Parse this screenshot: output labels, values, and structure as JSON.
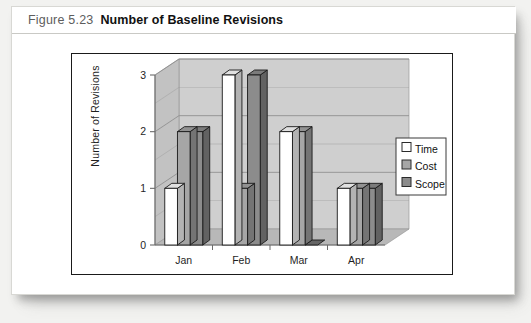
{
  "caption": {
    "figure_number": "Figure 5.23",
    "title": "Number of Baseline Revisions"
  },
  "chart_data": {
    "type": "bar",
    "title": "Number of Baseline Revisions",
    "xlabel": "",
    "ylabel": "Number of Revisions",
    "categories": [
      "Jan",
      "Feb",
      "Mar",
      "Apr"
    ],
    "series": [
      {
        "name": "Time",
        "color": "#ffffff",
        "values": [
          1,
          3,
          2,
          1
        ]
      },
      {
        "name": "Cost",
        "color": "#a6a6a6",
        "values": [
          2,
          1,
          2,
          1
        ]
      },
      {
        "name": "Scope",
        "color": "#8c8c8c",
        "values": [
          2,
          3,
          0,
          1
        ]
      }
    ],
    "ylim": [
      0,
      3
    ],
    "yticks": [
      0,
      1,
      2,
      3
    ],
    "ytick_labels": [
      "0",
      "1",
      "2",
      "3"
    ],
    "minor_tick_step": 0.5,
    "grid": true,
    "legend_position": "right",
    "render": "3d-clustered-column",
    "plot_background": "#cfcfcf",
    "plot_wall_shade": "#c2c2c2",
    "plot_floor_shade": "#b8b8b8",
    "axis_color": "#6b6b6b",
    "gridline_color": "#8f8f8f",
    "bar_outline": "#1a1a1a"
  },
  "legend": {
    "entries": [
      {
        "label": "Time",
        "swatch": "#ffffff"
      },
      {
        "label": "Cost",
        "swatch": "#a6a6a6"
      },
      {
        "label": "Scope",
        "swatch": "#8c8c8c"
      }
    ]
  }
}
